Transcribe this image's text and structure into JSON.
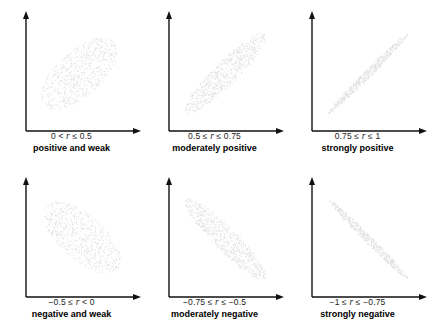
{
  "figure": {
    "colors": {
      "axis": "#111111",
      "points": "#dcdcdc",
      "text": "#111111",
      "background": "#ffffff"
    }
  },
  "panels": [
    {
      "id": "positive-weak",
      "range_prefix": "0 < ",
      "range_var": "r",
      "range_suffix": " ≤ 0.5",
      "range_full": "0 < r ≤ 0.5",
      "description": "positive and weak",
      "r_low": 0.0,
      "r_high": 0.5,
      "slope_sign": "positive",
      "spread": "wide"
    },
    {
      "id": "moderately-positive",
      "range_prefix": "0.5 ≤ ",
      "range_var": "r",
      "range_suffix": " ≤ 0.75",
      "range_full": "0.5 ≤ r ≤ 0.75",
      "description": "moderately positive",
      "r_low": 0.5,
      "r_high": 0.75,
      "slope_sign": "positive",
      "spread": "medium"
    },
    {
      "id": "strongly-positive",
      "range_prefix": "0.75 ≤ ",
      "range_var": "r",
      "range_suffix": " ≤ 1",
      "range_full": "0.75 ≤ r ≤ 1",
      "description": "strongly positive",
      "r_low": 0.75,
      "r_high": 1.0,
      "slope_sign": "positive",
      "spread": "tight"
    },
    {
      "id": "negative-weak",
      "range_prefix": "−0.5 ≤ ",
      "range_var": "r",
      "range_suffix": " < 0",
      "range_full": "−0.5 ≤ r < 0",
      "description": "negative and weak",
      "r_low": -0.5,
      "r_high": 0.0,
      "slope_sign": "negative",
      "spread": "wide"
    },
    {
      "id": "moderately-negative",
      "range_prefix": "−0.75 ≤ ",
      "range_var": "r",
      "range_suffix": " ≤ −0.5",
      "range_full": "−0.75 ≤ r ≤ −0.5",
      "description": "moderately negative",
      "r_low": -0.75,
      "r_high": -0.5,
      "slope_sign": "negative",
      "spread": "medium"
    },
    {
      "id": "strongly-negative",
      "range_prefix": "−1 ≤ ",
      "range_var": "r",
      "range_suffix": " ≤ −0.75",
      "range_full": "−1 ≤ r ≤ −0.75",
      "description": "strongly negative",
      "r_low": -1.0,
      "r_high": -0.75,
      "slope_sign": "negative",
      "spread": "tight"
    }
  ],
  "chart_data": {
    "type": "scatter",
    "xlabel": "",
    "ylabel": "",
    "grid": false,
    "legend": "none",
    "axes_style": "two-axis arrows (x right, y up), no tick labels",
    "xlim": [
      0,
      1
    ],
    "ylim": [
      0,
      1
    ],
    "panel_layout": {
      "rows": 2,
      "cols": 3
    },
    "series": [
      {
        "name": "0 < r ≤ 0.5",
        "caption": "positive and weak",
        "r_estimate": 0.35,
        "n_points": 800,
        "cloud_shape": "broad diagonal ellipse, up-right",
        "angle_deg": 42,
        "semi_major": 0.44,
        "semi_minor": 0.21,
        "center": [
          0.47,
          0.5
        ]
      },
      {
        "name": "0.5 ≤ r ≤ 0.75",
        "caption": "moderately positive",
        "r_estimate": 0.65,
        "n_points": 800,
        "cloud_shape": "narrow diagonal band, up-right",
        "angle_deg": 45,
        "semi_major": 0.52,
        "semi_minor": 0.11,
        "center": [
          0.5,
          0.5
        ]
      },
      {
        "name": "0.75 ≤ r ≤ 1",
        "caption": "strongly positive",
        "r_estimate": 0.92,
        "n_points": 600,
        "cloud_shape": "tight diagonal line, up-right",
        "angle_deg": 45,
        "semi_major": 0.52,
        "semi_minor": 0.035,
        "center": [
          0.5,
          0.5
        ]
      },
      {
        "name": "−0.5 ≤ r < 0",
        "caption": "negative and weak",
        "r_estimate": -0.35,
        "n_points": 800,
        "cloud_shape": "broad diagonal ellipse, down-right",
        "angle_deg": -42,
        "semi_major": 0.44,
        "semi_minor": 0.21,
        "center": [
          0.5,
          0.52
        ]
      },
      {
        "name": "−0.75 ≤ r ≤ −0.5",
        "caption": "moderately negative",
        "r_estimate": -0.65,
        "n_points": 800,
        "cloud_shape": "narrow diagonal band, down-right",
        "angle_deg": -45,
        "semi_major": 0.52,
        "semi_minor": 0.11,
        "center": [
          0.5,
          0.5
        ]
      },
      {
        "name": "−1 ≤ r ≤ −0.75",
        "caption": "strongly negative",
        "r_estimate": -0.92,
        "n_points": 600,
        "cloud_shape": "tight diagonal line, down-right",
        "angle_deg": -45,
        "semi_major": 0.52,
        "semi_minor": 0.035,
        "center": [
          0.5,
          0.5
        ]
      }
    ]
  }
}
